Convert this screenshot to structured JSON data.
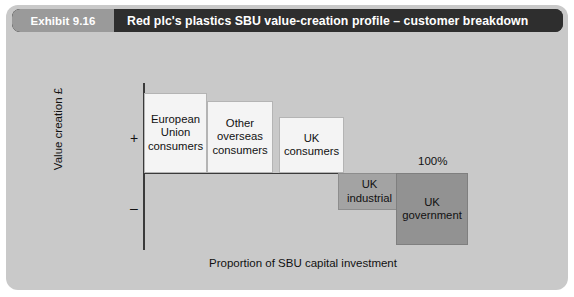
{
  "exhibit": {
    "number": "Exhibit 9.16",
    "title": "Red plc's plastics SBU value-creation profile – customer breakdown"
  },
  "chart_data": {
    "type": "bar",
    "title": "Red plc's plastics SBU value-creation profile – customer breakdown",
    "xlabel": "Proportion of SBU capital investment",
    "ylabel": "Value creation £",
    "grid": false,
    "legend": "none",
    "orientation": "waterfall-profile",
    "axis_markers": {
      "positive": "+",
      "negative": "–",
      "x_end": "100%"
    },
    "categories": [
      "European Union consumers",
      "Other overseas consumers",
      "UK consumers",
      "UK industrial",
      "UK government"
    ],
    "values": [
      80,
      72,
      56,
      -37,
      -72
    ],
    "widths": [
      63,
      66,
      65,
      63,
      72
    ],
    "bars": [
      {
        "label_lines": [
          "European",
          "Union",
          "consumers"
        ],
        "value": 80,
        "sign": "positive",
        "color": "#f4f4f4"
      },
      {
        "label_lines": [
          "Other",
          "overseas",
          "consumers"
        ],
        "value": 72,
        "sign": "positive",
        "color": "#f4f4f4"
      },
      {
        "label_lines": [
          "UK",
          "consumers"
        ],
        "value": 56,
        "sign": "positive",
        "color": "#f4f4f4"
      },
      {
        "label_lines": [
          "UK",
          "industrial"
        ],
        "value": -37,
        "sign": "negative",
        "color": "#a3a3a3"
      },
      {
        "label_lines": [
          "UK",
          "government"
        ],
        "value": -72,
        "sign": "negative",
        "color": "#929292"
      }
    ]
  },
  "labels": {
    "bar_eu": "European Union consumers",
    "bar_overseas": "Other overseas consumers",
    "bar_uk_consumers": "UK consumers",
    "bar_uk_industrial": "UK industrial",
    "bar_uk_government": "UK government",
    "y_axis": "Value creation £",
    "x_axis": "Proportion of SBU capital investment",
    "plus": "+",
    "minus": "–",
    "hundred_percent": "100%"
  },
  "colors": {
    "panel_background": "#c9c9c9",
    "header_dark": "#2e2e2e",
    "header_gray": "#9a9a9a",
    "bar_positive": "#f4f4f4",
    "bar_mid": "#a3a3a3",
    "bar_dark": "#929292",
    "axis": "#3a3a3a"
  }
}
